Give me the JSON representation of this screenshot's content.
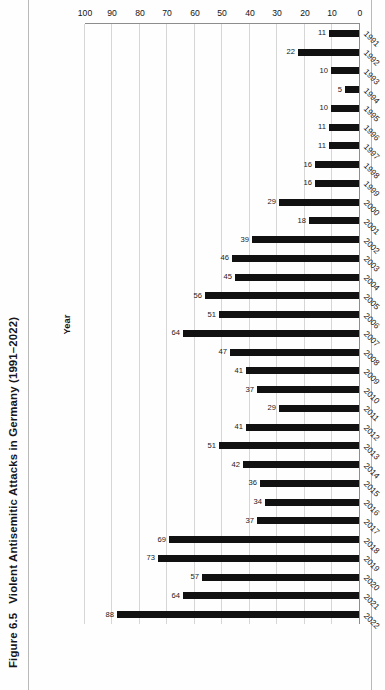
{
  "figure": {
    "number": "Figure 6.5",
    "title": "Violent Antisemitic Attacks in Germany (1991–2022)"
  },
  "axis_titles": {
    "value_axis": "Attacks",
    "category_axis": "Year"
  },
  "colors": {
    "bar": "#111111",
    "gridline": "#d6d6d6",
    "axis": "#8d8d8d",
    "text": "#17161a",
    "page_rule": "#b9b9b9"
  },
  "chart_data": {
    "type": "bar",
    "orientation": "horizontal",
    "title": "Figure 6.5  Violent Antisemitic Attacks in Germany (1991–2022)",
    "xlabel": "Attacks",
    "ylabel": "Year",
    "xlim": [
      0,
      100
    ],
    "xticks": [
      0,
      10,
      20,
      30,
      40,
      50,
      60,
      70,
      80,
      90,
      100
    ],
    "grid": true,
    "legend": false,
    "rotation_note": "plot rendered upside-down (180°) on the page; figure caption rotated 90° along left margin",
    "categories": [
      "1991",
      "1992",
      "1993",
      "1994",
      "1995",
      "1996",
      "1997",
      "1998",
      "1999",
      "2000",
      "2001",
      "2002",
      "2003",
      "2004",
      "2005",
      "2006",
      "2007",
      "2008",
      "2009",
      "2010",
      "2011",
      "2012",
      "2013",
      "2014",
      "2015",
      "2016",
      "2017",
      "2018",
      "2019",
      "2020",
      "2021",
      "2022"
    ],
    "values": [
      11,
      22,
      10,
      5,
      10,
      11,
      11,
      16,
      16,
      29,
      18,
      39,
      46,
      45,
      56,
      51,
      64,
      47,
      41,
      37,
      29,
      41,
      51,
      42,
      36,
      34,
      37,
      69,
      73,
      57,
      64,
      88
    ],
    "data_labels": [
      "11",
      "22",
      "10",
      "5",
      "10",
      "11",
      "11",
      "16",
      "16",
      "29",
      "18",
      "39",
      "46",
      "45",
      "56",
      "51",
      "64",
      "47",
      "41",
      "37",
      "29",
      "41",
      "51",
      "42",
      "36",
      "34",
      "37",
      "69",
      "73",
      "57",
      "64",
      "88"
    ]
  }
}
